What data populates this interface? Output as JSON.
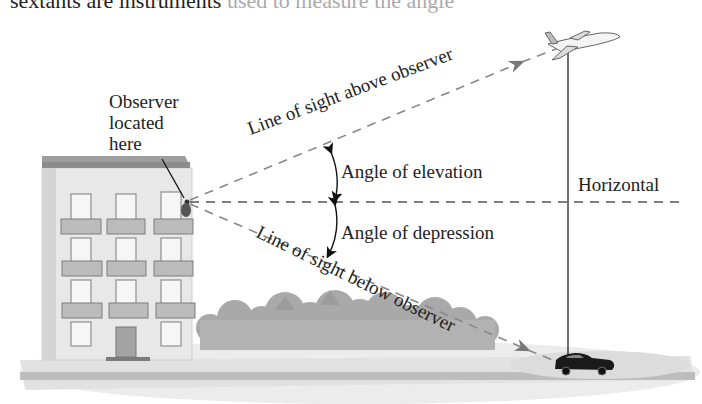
{
  "header_text": {
    "visible": "sextants are instruments",
    "faded": " used to measure the angle"
  },
  "labels": {
    "observer": [
      "Observer",
      "located",
      "here"
    ],
    "line_of_sight_above": "Line of sight above observer",
    "angle_of_elevation": "Angle of elevation",
    "horizontal": "Horizontal",
    "angle_of_depression": "Angle of depression",
    "line_of_sight_below": "Line of sight below observer"
  },
  "colors": {
    "dashed_line": "#777777",
    "building_wall": "#e6e6e6",
    "building_roof": "#9a9a9a",
    "trees": "#a8a8a8",
    "ground": "#d9d9d9",
    "car": "#1a1a1a",
    "text": "#222222"
  },
  "geometry": {
    "observer": [
      187,
      202
    ],
    "airplane": [
      562,
      50
    ],
    "car": [
      565,
      362
    ],
    "horizontal_end": [
      682,
      202
    ],
    "vertical_x": 568
  }
}
